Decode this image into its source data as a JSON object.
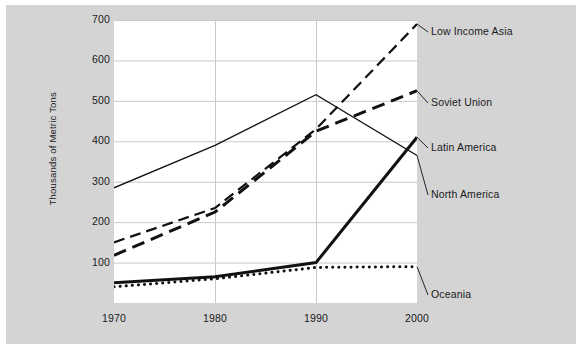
{
  "chart_data": {
    "type": "line",
    "title": "",
    "subtitle": "",
    "xlabel": "",
    "ylabel": "Thousands of Metric Tons",
    "x": [
      1970,
      1980,
      1990,
      2000
    ],
    "xticklabels": [
      "1970",
      "1980",
      "1990",
      "2000"
    ],
    "yticks": [
      100,
      200,
      300,
      400,
      500,
      600,
      700
    ],
    "yticklabels": [
      "100",
      "200",
      "300",
      "400",
      "500",
      "600",
      "700"
    ],
    "xlim": [
      1970,
      2000
    ],
    "ylim": [
      0,
      700
    ],
    "grid": "horizontal-and-vertical",
    "legend_position": "right-inline-labels",
    "series": [
      {
        "name": "Low Income Asia",
        "values": [
          150,
          235,
          430,
          690
        ],
        "style": "long-dash",
        "color": "#111111",
        "width": 2.2,
        "label_x": 431,
        "label_y": 25
      },
      {
        "name": "Soviet Union",
        "values": [
          118,
          225,
          425,
          525
        ],
        "style": "heavy-dash",
        "color": "#111111",
        "width": 3.0,
        "label_x": 431,
        "label_y": 96
      },
      {
        "name": "Latin America",
        "values": [
          50,
          65,
          100,
          410
        ],
        "style": "solid-thick",
        "color": "#111111",
        "width": 3.0,
        "label_x": 431,
        "label_y": 141
      },
      {
        "name": "North America",
        "values": [
          285,
          390,
          515,
          365
        ],
        "style": "solid-thin",
        "color": "#111111",
        "width": 1.3,
        "label_x": 431,
        "label_y": 188
      },
      {
        "name": "Oceania",
        "values": [
          40,
          60,
          88,
          90
        ],
        "style": "dotted",
        "color": "#111111",
        "width": 3.0,
        "label_x": 431,
        "label_y": 288
      }
    ]
  },
  "colors": {
    "card_background": "#d4d4d4",
    "panel_background": "#ffffff",
    "grid": "#c9c9c9",
    "ink": "#111111",
    "page": "#ffffff"
  }
}
